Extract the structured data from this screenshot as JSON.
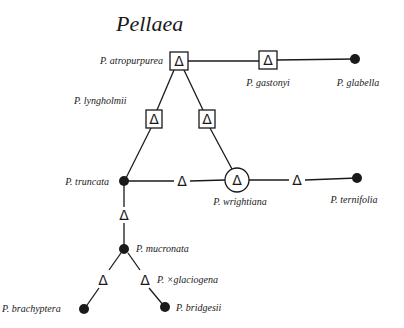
{
  "title": "Pellaea",
  "colors": {
    "ink": "#1a1a1a",
    "background": "#ffffff"
  },
  "legend_symbols": {
    "filled-circle": "diploid/base species",
    "delta": "Δ",
    "boxed-delta": "Δ in square",
    "circled-delta": "Δ in circle"
  },
  "nodes": {
    "atropurpurea": {
      "label": "P. atropurpurea",
      "symbol": "boxed-delta"
    },
    "gastonyi": {
      "label": "P. gastonyi",
      "symbol": "boxed-delta"
    },
    "glabella": {
      "label": "P. glabella",
      "symbol": "filled-circle"
    },
    "lyngholmii": {
      "label": "P. lyngholmii",
      "symbol": "boxed-delta"
    },
    "lyngholmii_right": {
      "label": "",
      "symbol": "boxed-delta"
    },
    "truncata": {
      "label": "P. truncata",
      "symbol": "filled-circle"
    },
    "truncata_wrightiana_delta": {
      "label": "",
      "symbol": "delta"
    },
    "wrightiana": {
      "label": "P. wrightiana",
      "symbol": "circled-delta"
    },
    "wrightiana_ternifolia_delta": {
      "label": "",
      "symbol": "delta"
    },
    "ternifolia": {
      "label": "P. ternifolia",
      "symbol": "filled-circle"
    },
    "truncata_mucronata_delta": {
      "label": "",
      "symbol": "delta"
    },
    "mucronata": {
      "label": "P. mucronata",
      "symbol": "filled-circle"
    },
    "brachyptera_delta": {
      "label": "",
      "symbol": "delta"
    },
    "glaciogena": {
      "label": "P. ×glaciogena",
      "symbol": "delta"
    },
    "brachyptera": {
      "label": "P. brachyptera",
      "symbol": "filled-circle"
    },
    "bridgesii": {
      "label": "P. bridgesii",
      "symbol": "filled-circle"
    }
  },
  "delta_glyph": "Δ"
}
